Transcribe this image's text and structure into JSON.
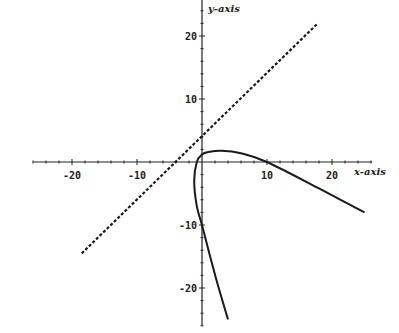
{
  "chart_data": {
    "type": "line",
    "title": "",
    "xlabel": "x-axis",
    "ylabel": "y-axis",
    "xlim": [
      -27,
      27
    ],
    "ylim": [
      -26,
      26
    ],
    "grid": false,
    "x_ticks": [
      -20,
      -10,
      10,
      20
    ],
    "y_ticks": [
      20,
      10,
      -10,
      -20
    ],
    "x_tick_labels": [
      "-20",
      "-10",
      "10",
      "20"
    ],
    "y_tick_labels": [
      "20",
      "10",
      "-10",
      "-20"
    ],
    "series": [
      {
        "name": "line",
        "style": "dashed",
        "equation": "y = x + 4",
        "points": [
          [
            -18.5,
            -14.5
          ],
          [
            17.8,
            22
          ]
        ]
      },
      {
        "name": "curve",
        "style": "solid",
        "points": [
          [
            25,
            -8
          ],
          [
            18,
            -4.2
          ],
          [
            10,
            0
          ],
          [
            6,
            1.4
          ],
          [
            3,
            1.8
          ],
          [
            1,
            1.6
          ],
          [
            0,
            1.2
          ],
          [
            -0.8,
            0
          ],
          [
            -1.2,
            -3
          ],
          [
            -0.8,
            -7
          ],
          [
            0,
            -10
          ],
          [
            1,
            -14
          ],
          [
            2.3,
            -19
          ],
          [
            4,
            -25
          ]
        ]
      }
    ]
  }
}
